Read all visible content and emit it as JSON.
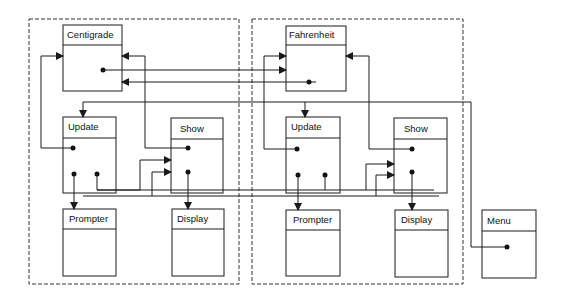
{
  "diagram": {
    "type": "object-interaction-diagram",
    "groups": [
      {
        "id": "centigrade-group",
        "label": ""
      },
      {
        "id": "fahrenheit-group",
        "label": ""
      }
    ],
    "objects": {
      "centigrade": {
        "label": "Centigrade"
      },
      "update_left": {
        "label": "Update"
      },
      "show_left": {
        "label": "Show"
      },
      "prompter_left": {
        "label": "Prompter"
      },
      "display_left": {
        "label": "Display"
      },
      "fahrenheit": {
        "label": "Fahrenheit"
      },
      "update_right": {
        "label": "Update"
      },
      "show_right": {
        "label": "Show"
      },
      "prompter_right": {
        "label": "Prompter"
      },
      "display_right": {
        "label": "Display"
      },
      "menu": {
        "label": "Menu"
      }
    },
    "colors": {
      "line": "#1a1a1a",
      "dashed_border": "#333333",
      "background": "#ffffff"
    }
  }
}
